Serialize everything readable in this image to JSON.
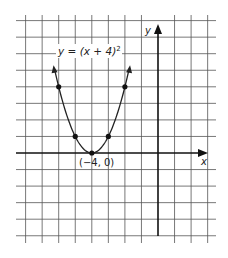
{
  "chart_data": {
    "type": "line",
    "title": "",
    "function_label": "y = (x + 4)",
    "function_exponent": "2",
    "xlabel": "x",
    "ylabel": "y",
    "xlim": [
      -8,
      3.5
    ],
    "ylim": [
      -5,
      8
    ],
    "grid": true,
    "grid_spacing": 1,
    "vertex": {
      "x": -4,
      "y": 0,
      "label": "(−4, 0)"
    },
    "points": [
      {
        "x": -6,
        "y": 4
      },
      {
        "x": -5,
        "y": 1
      },
      {
        "x": -4,
        "y": 0
      },
      {
        "x": -3,
        "y": 1
      },
      {
        "x": -2,
        "y": 4
      }
    ],
    "curve": {
      "x_start": -6.25,
      "x_end": -1.75,
      "arrows_both_ends": true
    }
  },
  "colors": {
    "grid": "#555555",
    "axis": "#111111",
    "curve": "#222222",
    "point": "#111111"
  }
}
